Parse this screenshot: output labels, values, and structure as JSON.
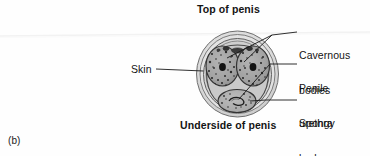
{
  "figure": {
    "panel_label": "(b)",
    "title_top": "Top of penis",
    "title_bottom": "Underside of penis",
    "type": "anatomical cross-section diagram"
  },
  "labels": {
    "skin": "Skin",
    "cavernous_bodies": "Cavernous\nbodies",
    "cavernous_bodies_line1": "Cavernous",
    "cavernous_bodies_line2": "bodies",
    "penile_urethra_line1": "Penile",
    "penile_urethra_line2": "urethra",
    "spongy_body_line1": "Spongy",
    "spongy_body_line2": "body"
  },
  "colors": {
    "text": "#141414",
    "background": "#fefefe",
    "leader_line": "#1a1a1a",
    "skin_outer": "#d8d8d8",
    "skin_mid": "#c2c2c2",
    "tissue_fill": "#a9a9a9",
    "cavernous_fill": "#9d9d9d",
    "spongy_fill": "#b0b0b0",
    "artery_dark": "#141414",
    "outline": "#3a3a3a"
  }
}
